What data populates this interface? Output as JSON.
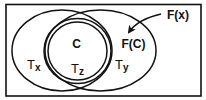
{
  "diagram": {
    "type": "set-relationship",
    "stroke_color": "#111111",
    "background": "#ffffff",
    "sets": [
      {
        "id": "Tx",
        "label_main": "T",
        "label_sub": "x"
      },
      {
        "id": "Ty",
        "label_main": "T",
        "label_sub": "y"
      },
      {
        "id": "Tz",
        "label_main": "T",
        "label_sub": "z"
      },
      {
        "id": "C",
        "label": "C"
      }
    ],
    "labels": {
      "c": "C",
      "fc": "F(C)",
      "fx": "F(x)",
      "tx_main": "T",
      "tx_sub": "x",
      "ty_main": "T",
      "ty_sub": "y",
      "tz_main": "T",
      "tz_sub": "z"
    },
    "arrow": {
      "from": "F(x)",
      "to": "F(C)"
    }
  }
}
